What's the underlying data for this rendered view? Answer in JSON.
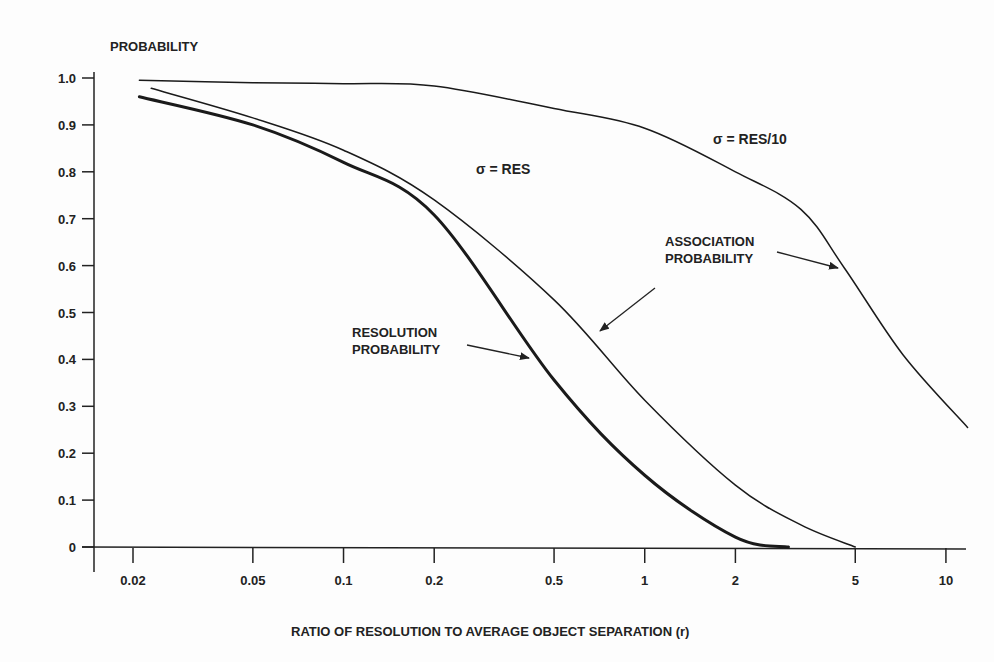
{
  "chart_data": {
    "type": "line",
    "title": "",
    "ylabel": "PROBABILITY",
    "xlabel": "RATIO OF RESOLUTION TO AVERAGE OBJECT SEPARATION (r)",
    "xscale": "log",
    "xlim": [
      0.016,
      12
    ],
    "ylim": [
      0,
      1.0
    ],
    "grid": false,
    "x_ticks": [
      "0.02",
      "0.05",
      "0.1",
      "0.2",
      "0.5",
      "1",
      "2",
      "5",
      "10"
    ],
    "y_ticks": [
      "0",
      "0.1",
      "0.2",
      "0.3",
      "0.4",
      "0.5",
      "0.6",
      "0.7",
      "0.8",
      "0.9",
      "1.0"
    ],
    "series": [
      {
        "name": "σ = RES/10 (Association Probability)",
        "style": "thin",
        "x": [
          0.021,
          0.05,
          0.1,
          0.2,
          0.5,
          1,
          2,
          3.3,
          4.6,
          7.2,
          11.8
        ],
        "y": [
          0.995,
          0.99,
          0.988,
          0.983,
          0.935,
          0.893,
          0.8,
          0.72,
          0.595,
          0.41,
          0.255
        ]
      },
      {
        "name": "σ = RES (Association Probability)",
        "style": "thin",
        "x": [
          0.023,
          0.05,
          0.1,
          0.2,
          0.5,
          1,
          2,
          3.3,
          5
        ],
        "y": [
          0.978,
          0.915,
          0.846,
          0.74,
          0.527,
          0.313,
          0.132,
          0.047,
          0.0
        ]
      },
      {
        "name": "Resolution Probability",
        "style": "thick",
        "x": [
          0.021,
          0.05,
          0.1,
          0.2,
          0.5,
          1,
          2,
          3.0
        ],
        "y": [
          0.96,
          0.9,
          0.82,
          0.708,
          0.356,
          0.153,
          0.021,
          0.0
        ]
      }
    ],
    "annotations": [
      {
        "text": "σ = RES/10",
        "near_series": 0
      },
      {
        "text": "σ = RES",
        "near_series": 1
      },
      {
        "text": "ASSOCIATION PROBABILITY",
        "arrows_to": [
          0,
          1
        ]
      },
      {
        "text": "RESOLUTION PROBABILITY",
        "arrows_to": [
          2
        ]
      }
    ]
  },
  "labels": {
    "y_axis_title": "PROBABILITY",
    "x_axis_title": "RATIO OF RESOLUTION TO AVERAGE OBJECT SEPARATION (r)",
    "sigma_res10": "σ  = RES/10",
    "sigma_res": "σ = RES",
    "assoc_line1": "ASSOCIATION",
    "assoc_line2": "PROBABILITY",
    "res_line1": "RESOLUTION",
    "res_line2": "PROBABILITY"
  }
}
